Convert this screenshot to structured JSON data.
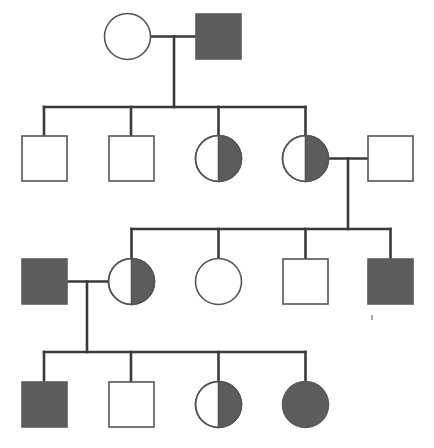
{
  "figure": {
    "kind": "pedigree-chart",
    "title": "",
    "width": 434,
    "height": 448,
    "background_color": "#ffffff"
  },
  "style": {
    "line_color": "#3a3a3a",
    "symbol_stroke_color": "#555555",
    "affected_fill_color": "#5c5c5c",
    "unaffected_fill_color": "#ffffff",
    "line_width": 2.6,
    "symbol_stroke_width": 1.6,
    "symbol_size": 45,
    "circle_radius": 23
  },
  "legend_meaning": {
    "square": "male",
    "circle": "female",
    "filled": "affected",
    "open": "unaffected",
    "half_filled": "carrier"
  },
  "chart_data": {
    "type": "diagram",
    "generations": 4,
    "individuals": [
      {
        "id": "I-1",
        "generation": 1,
        "shape": "circle",
        "sex": "female",
        "fill": "open",
        "status": "unaffected",
        "cx": 127.5,
        "cy": 36.5,
        "r": 23
      },
      {
        "id": "I-2",
        "generation": 1,
        "shape": "square",
        "sex": "male",
        "fill": "filled",
        "status": "affected",
        "x": 196,
        "y": 14,
        "size": 45
      },
      {
        "id": "II-1",
        "generation": 2,
        "shape": "square",
        "sex": "male",
        "fill": "open",
        "status": "unaffected",
        "x": 22,
        "y": 136,
        "size": 45
      },
      {
        "id": "II-2",
        "generation": 2,
        "shape": "square",
        "sex": "male",
        "fill": "open",
        "status": "unaffected",
        "x": 109,
        "y": 136,
        "size": 45
      },
      {
        "id": "II-3",
        "generation": 2,
        "shape": "circle",
        "sex": "female",
        "fill": "half",
        "status": "carrier",
        "cx": 218.5,
        "cy": 158.5,
        "r": 23
      },
      {
        "id": "II-4",
        "generation": 2,
        "shape": "circle",
        "sex": "female",
        "fill": "half",
        "status": "carrier",
        "cx": 305.5,
        "cy": 158.5,
        "r": 23
      },
      {
        "id": "II-5",
        "generation": 2,
        "shape": "square",
        "sex": "male",
        "fill": "open",
        "status": "unaffected",
        "x": 368,
        "y": 136,
        "size": 45
      },
      {
        "id": "III-1",
        "generation": 3,
        "shape": "square",
        "sex": "male",
        "fill": "filled",
        "status": "affected",
        "x": 22,
        "y": 259,
        "size": 45
      },
      {
        "id": "III-2",
        "generation": 3,
        "shape": "circle",
        "sex": "female",
        "fill": "half",
        "status": "carrier",
        "cx": 131.5,
        "cy": 281.5,
        "r": 23
      },
      {
        "id": "III-3",
        "generation": 3,
        "shape": "circle",
        "sex": "female",
        "fill": "open",
        "status": "unaffected",
        "cx": 218.5,
        "cy": 281.5,
        "r": 23
      },
      {
        "id": "III-4",
        "generation": 3,
        "shape": "square",
        "sex": "male",
        "fill": "open",
        "status": "unaffected",
        "x": 283,
        "y": 259,
        "size": 45
      },
      {
        "id": "III-5",
        "generation": 3,
        "shape": "square",
        "sex": "male",
        "fill": "filled",
        "status": "affected",
        "x": 368,
        "y": 259,
        "size": 45
      },
      {
        "id": "IV-1",
        "generation": 4,
        "shape": "square",
        "sex": "male",
        "fill": "filled",
        "status": "affected",
        "x": 22,
        "y": 382,
        "size": 45
      },
      {
        "id": "IV-2",
        "generation": 4,
        "shape": "square",
        "sex": "male",
        "fill": "open",
        "status": "unaffected",
        "x": 109,
        "y": 382,
        "size": 45
      },
      {
        "id": "IV-3",
        "generation": 4,
        "shape": "circle",
        "sex": "female",
        "fill": "half",
        "status": "carrier",
        "cx": 218.5,
        "cy": 404.5,
        "r": 23
      },
      {
        "id": "IV-4",
        "generation": 4,
        "shape": "circle",
        "sex": "female",
        "fill": "filled",
        "status": "affected",
        "cx": 305.5,
        "cy": 404.5,
        "r": 23
      }
    ],
    "matings": [
      {
        "id": "M1",
        "partners": [
          "I-1",
          "I-2"
        ],
        "mating_line_y": 36.5,
        "mating_line_x1": 150.5,
        "mating_line_x2": 196,
        "descent_x": 174,
        "descent_y2": 107,
        "children": [
          "II-1",
          "II-2",
          "II-3",
          "II-4"
        ]
      },
      {
        "id": "M2",
        "partners": [
          "II-4",
          "II-5"
        ],
        "mating_line_y": 158.5,
        "mating_line_x1": 328.5,
        "mating_line_x2": 368,
        "descent_x": 348,
        "descent_y2": 229,
        "children": [
          "III-2",
          "III-3",
          "III-4",
          "III-5"
        ]
      },
      {
        "id": "M3",
        "partners": [
          "III-1",
          "III-2"
        ],
        "mating_line_y": 281.5,
        "mating_line_x1": 67,
        "mating_line_x2": 108.5,
        "descent_x": 87,
        "descent_y2": 352,
        "children": [
          "IV-1",
          "IV-2",
          "IV-3",
          "IV-4"
        ]
      }
    ],
    "sibships": [
      {
        "id": "S1",
        "mating": "M1",
        "bar_y": 107,
        "bar_x1": 44,
        "bar_x2": 305.5,
        "drops": [
          {
            "child": "II-1",
            "x": 44,
            "y2": 136
          },
          {
            "child": "II-2",
            "x": 131,
            "y2": 136
          },
          {
            "child": "II-3",
            "x": 218.5,
            "y2": 135.5
          },
          {
            "child": "II-4",
            "x": 305.5,
            "y2": 135.5
          }
        ]
      },
      {
        "id": "S2",
        "mating": "M2",
        "bar_y": 229,
        "bar_x1": 131.5,
        "bar_x2": 390.5,
        "drops": [
          {
            "child": "III-2",
            "x": 131.5,
            "y2": 258.5
          },
          {
            "child": "III-3",
            "x": 218.5,
            "y2": 258.5
          },
          {
            "child": "III-4",
            "x": 305.5,
            "y2": 259
          },
          {
            "child": "III-5",
            "x": 390.5,
            "y2": 259
          }
        ]
      },
      {
        "id": "S3",
        "mating": "M3",
        "bar_y": 352,
        "bar_x1": 44,
        "bar_x2": 305.5,
        "drops": [
          {
            "child": "IV-1",
            "x": 44,
            "y2": 382
          },
          {
            "child": "IV-2",
            "x": 131,
            "y2": 382
          },
          {
            "child": "IV-3",
            "x": 218.5,
            "y2": 381.5
          },
          {
            "child": "IV-4",
            "x": 305.5,
            "y2": 381.5
          }
        ]
      }
    ],
    "artifacts": [
      {
        "id": "speck-1",
        "x": 371,
        "y": 315,
        "w": 2,
        "h": 5
      }
    ]
  }
}
